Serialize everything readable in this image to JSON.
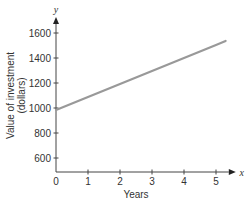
{
  "chart_data": {
    "type": "line",
    "title": "",
    "xlabel": "Years",
    "ylabel": "Value of investment (dollars)",
    "ylabel_lines": [
      "Value of investment",
      "(dollars)"
    ],
    "x_axis_name": "x",
    "y_axis_name": "y",
    "xlim": [
      0,
      5.3
    ],
    "ylim": [
      500,
      1650
    ],
    "x_ticks": [
      0,
      1,
      2,
      3,
      4,
      5
    ],
    "x_tick_labels": [
      "0",
      "1",
      "2",
      "3",
      "4",
      "5"
    ],
    "y_ticks": [
      600,
      800,
      1000,
      1200,
      1400,
      1600
    ],
    "y_tick_labels": [
      "600",
      "800",
      "1000",
      "1200",
      "1400",
      "1600"
    ],
    "grid": false,
    "legend": null,
    "series": [
      {
        "name": "Investment value",
        "color": "#999999",
        "x": [
          0,
          1,
          2,
          3,
          4,
          5,
          5.3
        ],
        "values": [
          985,
          1089,
          1193,
          1297,
          1401,
          1505,
          1536
        ]
      }
    ]
  }
}
